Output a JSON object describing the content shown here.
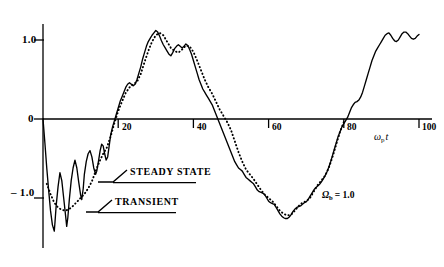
{
  "chart_data": {
    "type": "line",
    "title": "",
    "subtitle": "",
    "xlabel": "ω_p t",
    "ylabel": "",
    "xlim": [
      0,
      106
    ],
    "ylim": [
      -1.45,
      1.3
    ],
    "grid": false,
    "legend_position": "inline-callouts",
    "x_ticks": [
      20,
      40,
      60,
      80,
      100
    ],
    "x_tick_labels": [
      "20",
      "40",
      "60",
      "80",
      "100"
    ],
    "y_ticks": [
      1.0,
      0,
      -1.0
    ],
    "y_tick_labels": [
      "1.0",
      "0",
      "– 1.0"
    ],
    "annotations": [
      {
        "name": "omega-b-annotation",
        "text": "Ωb = 1.0",
        "x": 70,
        "y": -0.95
      },
      {
        "name": "x-axis-label",
        "text": "ωp t",
        "x": 96,
        "y": -0.3
      }
    ],
    "series": [
      {
        "name": "STEADY STATE",
        "style": "dotted",
        "color": "#000000",
        "callout_label": "STEADY STATE",
        "points": [
          [
            1.0,
            -0.82
          ],
          [
            2.0,
            -0.95
          ],
          [
            3.0,
            -1.06
          ],
          [
            4.0,
            -1.12
          ],
          [
            5.0,
            -1.15
          ],
          [
            6.0,
            -1.16
          ],
          [
            7.0,
            -1.14
          ],
          [
            8.0,
            -1.1
          ],
          [
            9.0,
            -1.05
          ],
          [
            10.0,
            -1.0
          ],
          [
            11.0,
            -0.95
          ],
          [
            12.0,
            -0.88
          ],
          [
            13.0,
            -0.79
          ],
          [
            14.0,
            -0.66
          ],
          [
            15.0,
            -0.54
          ],
          [
            16.0,
            -0.44
          ],
          [
            17.0,
            -0.36
          ],
          [
            18.0,
            -0.22
          ],
          [
            19.0,
            -0.05
          ],
          [
            20.0,
            0.1
          ],
          [
            21.0,
            0.22
          ],
          [
            22.0,
            0.33
          ],
          [
            23.0,
            0.4
          ],
          [
            24.0,
            0.44
          ],
          [
            25.0,
            0.47
          ],
          [
            26.0,
            0.57
          ],
          [
            27.0,
            0.72
          ],
          [
            28.0,
            0.86
          ],
          [
            29.0,
            0.98
          ],
          [
            30.0,
            1.06
          ],
          [
            31.0,
            1.09
          ],
          [
            32.0,
            1.06
          ],
          [
            33.0,
            0.98
          ],
          [
            34.0,
            0.9
          ],
          [
            35.0,
            0.86
          ],
          [
            36.0,
            0.84
          ],
          [
            37.0,
            0.88
          ],
          [
            38.0,
            0.93
          ],
          [
            39.0,
            0.92
          ],
          [
            40.0,
            0.85
          ],
          [
            41.0,
            0.74
          ],
          [
            42.0,
            0.62
          ],
          [
            43.0,
            0.5
          ],
          [
            44.0,
            0.4
          ],
          [
            45.0,
            0.32
          ],
          [
            46.0,
            0.22
          ],
          [
            47.0,
            0.12
          ],
          [
            48.0,
            0.04
          ],
          [
            49.0,
            -0.04
          ],
          [
            50.0,
            -0.14
          ],
          [
            51.0,
            -0.28
          ],
          [
            52.0,
            -0.42
          ],
          [
            53.0,
            -0.54
          ],
          [
            54.0,
            -0.64
          ],
          [
            55.0,
            -0.7
          ],
          [
            56.0,
            -0.76
          ],
          [
            57.0,
            -0.83
          ],
          [
            58.0,
            -0.9
          ],
          [
            59.0,
            -0.96
          ],
          [
            60.0,
            -1.0
          ],
          [
            61.0,
            -1.04
          ],
          [
            62.0,
            -1.1
          ],
          [
            63.0,
            -1.16
          ],
          [
            64.0,
            -1.2
          ],
          [
            65.0,
            -1.22
          ],
          [
            66.0,
            -1.21
          ],
          [
            67.0,
            -1.16
          ],
          [
            68.0,
            -1.1
          ],
          [
            69.0,
            -1.06
          ],
          [
            70.0,
            -1.04
          ],
          [
            71.0,
            -1.0
          ],
          [
            72.0,
            -0.92
          ],
          [
            73.0,
            -0.84
          ],
          [
            74.0,
            -0.78
          ],
          [
            75.0,
            -0.72
          ],
          [
            76.0,
            -0.62
          ],
          [
            77.0,
            -0.48
          ],
          [
            78.0,
            -0.32
          ],
          [
            79.0,
            -0.16
          ],
          [
            80.0,
            -0.04
          ]
        ]
      },
      {
        "name": "TRANSIENT",
        "style": "solid",
        "color": "#000000",
        "callout_label": "TRANSIENT",
        "points": [
          [
            0.0,
            0.0
          ],
          [
            0.5,
            -0.3
          ],
          [
            1.0,
            -0.62
          ],
          [
            1.5,
            -0.9
          ],
          [
            2.0,
            -1.16
          ],
          [
            2.5,
            -1.34
          ],
          [
            3.0,
            -1.42
          ],
          [
            3.2,
            -1.3
          ],
          [
            3.5,
            -1.1
          ],
          [
            4.0,
            -0.86
          ],
          [
            4.5,
            -0.68
          ],
          [
            5.0,
            -0.78
          ],
          [
            5.5,
            -1.0
          ],
          [
            6.0,
            -1.22
          ],
          [
            6.3,
            -1.36
          ],
          [
            6.6,
            -1.25
          ],
          [
            7.0,
            -1.02
          ],
          [
            7.5,
            -0.78
          ],
          [
            8.0,
            -0.62
          ],
          [
            8.5,
            -0.52
          ],
          [
            9.0,
            -0.62
          ],
          [
            9.5,
            -0.8
          ],
          [
            10.0,
            -0.96
          ],
          [
            10.3,
            -1.02
          ],
          [
            10.7,
            -0.88
          ],
          [
            11.0,
            -0.7
          ],
          [
            11.5,
            -0.54
          ],
          [
            12.0,
            -0.44
          ],
          [
            12.5,
            -0.4
          ],
          [
            13.0,
            -0.48
          ],
          [
            13.5,
            -0.62
          ],
          [
            14.0,
            -0.7
          ],
          [
            14.3,
            -0.66
          ],
          [
            14.8,
            -0.52
          ],
          [
            15.2,
            -0.4
          ],
          [
            15.6,
            -0.32
          ],
          [
            16.0,
            -0.34
          ],
          [
            16.4,
            -0.44
          ],
          [
            16.8,
            -0.52
          ],
          [
            17.2,
            -0.48
          ],
          [
            17.6,
            -0.34
          ],
          [
            18.0,
            -0.2
          ],
          [
            18.5,
            -0.1
          ],
          [
            19.0,
            -0.02
          ],
          [
            19.5,
            0.06
          ],
          [
            20.0,
            0.14
          ],
          [
            20.5,
            0.22
          ],
          [
            21.0,
            0.28
          ],
          [
            21.5,
            0.34
          ],
          [
            22.0,
            0.4
          ],
          [
            22.5,
            0.44
          ],
          [
            23.0,
            0.46
          ],
          [
            23.5,
            0.44
          ],
          [
            24.0,
            0.42
          ],
          [
            24.5,
            0.44
          ],
          [
            25.0,
            0.5
          ],
          [
            25.5,
            0.58
          ],
          [
            26.0,
            0.66
          ],
          [
            26.5,
            0.76
          ],
          [
            27.0,
            0.84
          ],
          [
            27.5,
            0.92
          ],
          [
            28.0,
            0.98
          ],
          [
            28.5,
            1.02
          ],
          [
            29.0,
            1.06
          ],
          [
            29.5,
            1.09
          ],
          [
            30.0,
            1.12
          ],
          [
            30.5,
            1.1
          ],
          [
            31.0,
            1.05
          ],
          [
            31.5,
            0.99
          ],
          [
            32.0,
            0.94
          ],
          [
            32.5,
            0.9
          ],
          [
            33.0,
            0.86
          ],
          [
            33.5,
            0.82
          ],
          [
            34.0,
            0.8
          ],
          [
            34.5,
            0.84
          ],
          [
            35.0,
            0.89
          ],
          [
            35.5,
            0.92
          ],
          [
            36.0,
            0.94
          ],
          [
            36.5,
            0.92
          ],
          [
            37.0,
            0.9
          ],
          [
            37.5,
            0.92
          ],
          [
            38.0,
            0.95
          ],
          [
            38.5,
            0.93
          ],
          [
            39.0,
            0.88
          ],
          [
            39.5,
            0.82
          ],
          [
            40.0,
            0.74
          ],
          [
            40.5,
            0.66
          ],
          [
            41.0,
            0.58
          ],
          [
            41.5,
            0.5
          ],
          [
            42.0,
            0.44
          ],
          [
            42.5,
            0.38
          ],
          [
            43.0,
            0.34
          ],
          [
            43.5,
            0.3
          ],
          [
            44.0,
            0.26
          ],
          [
            44.5,
            0.22
          ],
          [
            45.0,
            0.18
          ],
          [
            45.5,
            0.12
          ],
          [
            46.0,
            0.06
          ],
          [
            46.5,
            0.0
          ],
          [
            47.0,
            -0.06
          ],
          [
            47.5,
            -0.12
          ],
          [
            48.0,
            -0.18
          ],
          [
            48.5,
            -0.24
          ],
          [
            49.0,
            -0.3
          ],
          [
            49.5,
            -0.36
          ],
          [
            50.0,
            -0.42
          ],
          [
            50.5,
            -0.48
          ],
          [
            51.0,
            -0.54
          ],
          [
            51.5,
            -0.58
          ],
          [
            52.0,
            -0.62
          ],
          [
            52.5,
            -0.64
          ],
          [
            53.0,
            -0.66
          ],
          [
            53.5,
            -0.7
          ],
          [
            54.0,
            -0.74
          ],
          [
            54.5,
            -0.76
          ],
          [
            55.0,
            -0.78
          ],
          [
            55.5,
            -0.8
          ],
          [
            56.0,
            -0.82
          ],
          [
            56.5,
            -0.86
          ],
          [
            57.0,
            -0.9
          ],
          [
            57.5,
            -0.92
          ],
          [
            58.0,
            -0.93
          ],
          [
            58.5,
            -0.94
          ],
          [
            59.0,
            -0.96
          ],
          [
            59.5,
            -1.0
          ],
          [
            60.0,
            -1.04
          ],
          [
            60.5,
            -1.06
          ],
          [
            61.0,
            -1.07
          ],
          [
            61.5,
            -1.08
          ],
          [
            62.0,
            -1.12
          ],
          [
            62.5,
            -1.16
          ],
          [
            63.0,
            -1.2
          ],
          [
            63.5,
            -1.23
          ],
          [
            64.0,
            -1.25
          ],
          [
            64.5,
            -1.26
          ],
          [
            65.0,
            -1.26
          ],
          [
            65.5,
            -1.24
          ],
          [
            66.0,
            -1.21
          ],
          [
            66.5,
            -1.17
          ],
          [
            67.0,
            -1.14
          ],
          [
            67.5,
            -1.12
          ],
          [
            68.0,
            -1.11
          ],
          [
            68.5,
            -1.1
          ],
          [
            69.0,
            -1.08
          ],
          [
            69.5,
            -1.06
          ],
          [
            70.0,
            -1.05
          ],
          [
            70.5,
            -1.02
          ],
          [
            71.0,
            -0.98
          ],
          [
            71.5,
            -0.94
          ],
          [
            72.0,
            -0.9
          ],
          [
            72.5,
            -0.87
          ],
          [
            73.0,
            -0.85
          ],
          [
            73.5,
            -0.83
          ],
          [
            74.0,
            -0.8
          ],
          [
            74.5,
            -0.76
          ],
          [
            75.0,
            -0.72
          ],
          [
            75.5,
            -0.67
          ],
          [
            76.0,
            -0.61
          ],
          [
            76.5,
            -0.54
          ],
          [
            77.0,
            -0.46
          ],
          [
            77.5,
            -0.38
          ],
          [
            78.0,
            -0.3
          ],
          [
            78.5,
            -0.22
          ],
          [
            79.0,
            -0.16
          ],
          [
            79.5,
            -0.1
          ],
          [
            80.0,
            -0.06
          ],
          [
            80.5,
            -0.02
          ],
          [
            81.0,
            0.02
          ],
          [
            81.5,
            0.08
          ],
          [
            82.0,
            0.14
          ],
          [
            82.5,
            0.18
          ],
          [
            83.0,
            0.21
          ],
          [
            83.5,
            0.22
          ],
          [
            84.0,
            0.24
          ],
          [
            84.5,
            0.28
          ],
          [
            85.0,
            0.34
          ],
          [
            85.5,
            0.42
          ],
          [
            86.0,
            0.5
          ],
          [
            86.5,
            0.58
          ],
          [
            87.0,
            0.66
          ],
          [
            87.5,
            0.74
          ],
          [
            88.0,
            0.8
          ],
          [
            88.5,
            0.86
          ],
          [
            89.0,
            0.9
          ],
          [
            89.5,
            0.94
          ],
          [
            90.0,
            0.98
          ],
          [
            90.5,
            1.02
          ],
          [
            91.0,
            1.06
          ],
          [
            91.5,
            1.08
          ],
          [
            92.0,
            1.09
          ],
          [
            92.5,
            1.06
          ],
          [
            93.0,
            1.02
          ],
          [
            93.5,
            0.99
          ],
          [
            94.0,
            0.98
          ],
          [
            94.5,
            1.0
          ],
          [
            95.0,
            1.04
          ],
          [
            95.5,
            1.08
          ],
          [
            96.0,
            1.1
          ],
          [
            96.5,
            1.1
          ],
          [
            97.0,
            1.08
          ],
          [
            97.5,
            1.05
          ],
          [
            98.0,
            1.02
          ],
          [
            98.5,
            1.01
          ],
          [
            99.0,
            1.02
          ],
          [
            99.5,
            1.05
          ],
          [
            100.0,
            1.07
          ]
        ]
      }
    ]
  },
  "axes": {
    "y_label_top": "1.0",
    "y_label_mid": "0",
    "y_label_bottom": "– 1.0",
    "x_tick_20": "20",
    "x_tick_40": "40",
    "x_tick_60": "60",
    "x_tick_80": "80",
    "x_tick_100": "100"
  },
  "callouts": {
    "steady_state": "STEADY STATE",
    "transient": "TRANSIENT"
  },
  "annotations": {
    "omega_b_symbol": "Ω",
    "omega_b_sub": "b",
    "omega_b_value": "= 1.0",
    "x_axis_omega": "ω",
    "x_axis_sub": "p",
    "x_axis_t": "t"
  }
}
